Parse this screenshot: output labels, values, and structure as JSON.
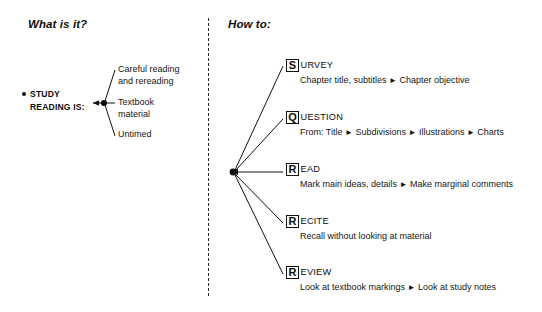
{
  "page": {
    "background_color": "#ffffff",
    "ink_color": "#111111"
  },
  "left_panel": {
    "heading": "What is it?",
    "root": {
      "bullet": "•",
      "line1": "STUDY",
      "line2": "READING IS:"
    },
    "branches": [
      {
        "label": "Careful reading\nand rereading"
      },
      {
        "label": "Textbook\nmaterial"
      },
      {
        "label": "Untimed"
      }
    ]
  },
  "right_panel": {
    "heading": "How to:",
    "separator_glyph": "►",
    "steps": [
      {
        "initial": "S",
        "rest": "URVEY",
        "full": "SURVEY",
        "detail_parts": [
          "Chapter title, subtitles",
          "Chapter objective"
        ]
      },
      {
        "initial": "Q",
        "rest": "UESTION",
        "full": "QUESTION",
        "detail_parts": [
          "From: Title",
          "Subdivisions",
          "Illustrations",
          "Charts"
        ]
      },
      {
        "initial": "R",
        "rest": "EAD",
        "full": "READ",
        "detail_parts": [
          "Mark main ideas, details",
          "Make marginal comments"
        ]
      },
      {
        "initial": "R",
        "rest": "ECITE",
        "full": "RECITE",
        "detail_parts": [
          "Recall without looking at material"
        ]
      },
      {
        "initial": "R",
        "rest": "EVIEW",
        "full": "REVIEW",
        "detail_parts": [
          "Look at textbook markings",
          "Look at study notes"
        ]
      }
    ]
  }
}
